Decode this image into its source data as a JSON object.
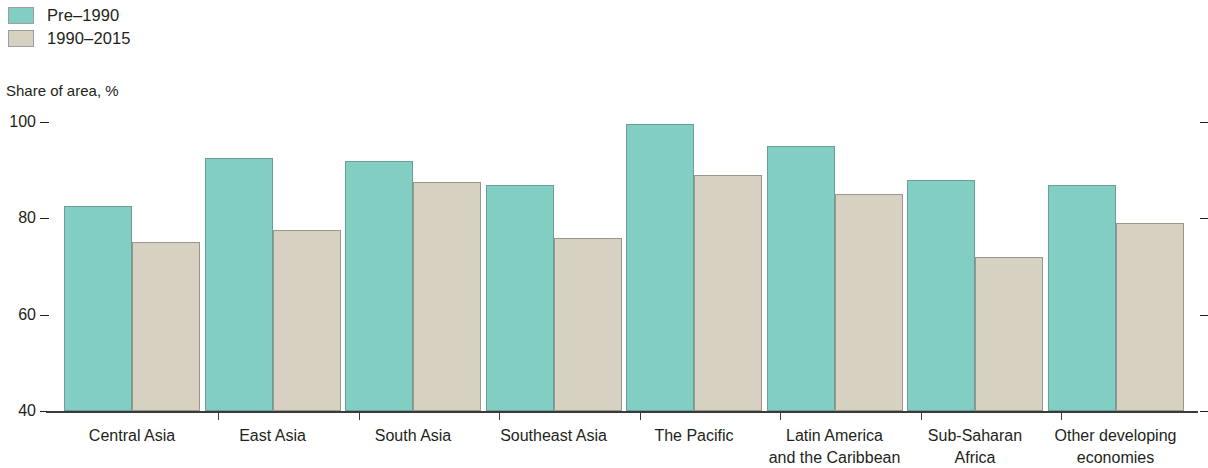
{
  "legend": {
    "position": "top-left",
    "items": [
      {
        "label": "Pre–1990",
        "color": "#83cec3",
        "key": "pre_1990"
      },
      {
        "label": "1990–2015",
        "color": "#d7d1c2",
        "key": "1990_2015"
      }
    ]
  },
  "axis": {
    "y_title": "Share of area, %",
    "y_ticks": [
      "100",
      "80",
      "60",
      "40"
    ]
  },
  "chart_data": {
    "type": "bar",
    "title": "",
    "subtitle": "",
    "xlabel": "",
    "ylabel": "Share of area, %",
    "ylim": [
      40,
      100
    ],
    "yticks": [
      40,
      60,
      80,
      100
    ],
    "grid": false,
    "legend_position": "top-left",
    "categories": [
      "Central Asia",
      "East Asia",
      "South Asia",
      "Southeast Asia",
      "The Pacific",
      "Latin America\nand the Caribbean",
      "Sub-Saharan\nAfrica",
      "Other developing\neconomies"
    ],
    "series": [
      {
        "name": "Pre–1990",
        "color": "#83cec3",
        "values": [
          82.5,
          92.5,
          92.0,
          87.0,
          99.5,
          95.0,
          88.0,
          87.0
        ]
      },
      {
        "name": "1990–2015",
        "color": "#d7d1c2",
        "values": [
          75.0,
          77.5,
          87.5,
          76.0,
          89.0,
          85.0,
          72.0,
          79.0
        ]
      }
    ]
  }
}
